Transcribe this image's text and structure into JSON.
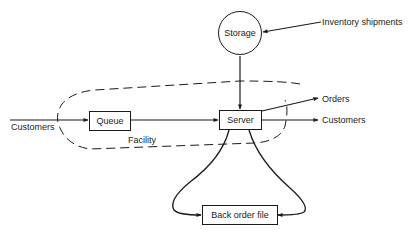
{
  "diagram": {
    "type": "flow-diagram",
    "nodes": {
      "storage": {
        "label": "Storage",
        "shape": "circle"
      },
      "queue": {
        "label": "Queue",
        "shape": "rectangle"
      },
      "server": {
        "label": "Server",
        "shape": "rectangle"
      },
      "back_order_file": {
        "label": "Back order file",
        "shape": "rectangle"
      }
    },
    "region": {
      "label": "Facility",
      "style": "dashed"
    },
    "external_labels": {
      "inventory_shipments": "Inventory shipments",
      "customers_in": "Customers",
      "orders": "Orders",
      "customers_out": "Customers"
    },
    "edges": [
      {
        "from": "inventory_shipments",
        "to": "storage"
      },
      {
        "from": "storage",
        "to": "server"
      },
      {
        "from": "customers_in",
        "to": "queue"
      },
      {
        "from": "queue",
        "to": "server"
      },
      {
        "from": "server",
        "to": "orders"
      },
      {
        "from": "server",
        "to": "customers_out"
      },
      {
        "from": "server",
        "to": "back_order_file",
        "side": "left"
      },
      {
        "from": "server",
        "to": "back_order_file",
        "side": "right"
      }
    ],
    "colors": {
      "stroke": "#1a1a1a",
      "background": "#ffffff"
    }
  }
}
